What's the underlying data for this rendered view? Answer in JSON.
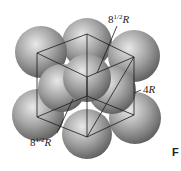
{
  "figure": {
    "labels": {
      "face_diagonal_top": {
        "base": "8",
        "exp": "1/2",
        "var": "R"
      },
      "body_diagonal": {
        "base": "4",
        "var": "R"
      },
      "face_diagonal_bottom": {
        "base": "8",
        "exp": "1/2",
        "var": "R"
      }
    },
    "side_text": "F",
    "colors": {
      "sphere_light": "#e6e6e6",
      "sphere_mid": "#9a9a9a",
      "sphere_dark": "#555555",
      "line": "#1a1a1a"
    }
  }
}
